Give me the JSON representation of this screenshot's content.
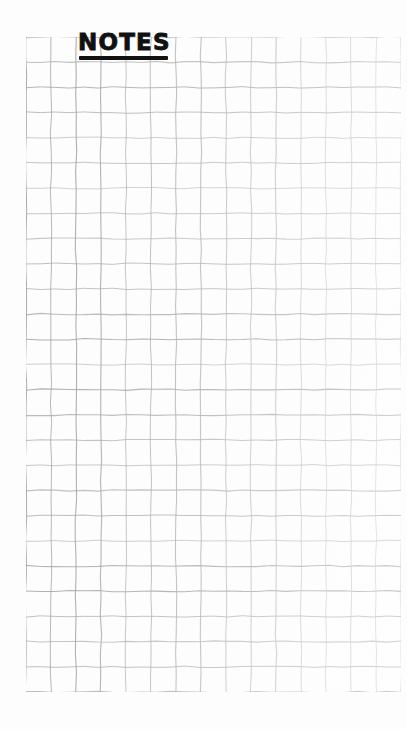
{
  "page": {
    "width": 407,
    "height": 729,
    "background_color": "#fdfdfd",
    "medium": "graph-paper-photo"
  },
  "title": {
    "text": "NOTES",
    "color": "#111111",
    "underline": true,
    "underline_color": "#111111"
  },
  "grid": {
    "columns": 15,
    "rows": 26,
    "cell_size_px": 25,
    "left_px": 26,
    "top_px": 37,
    "width_px": 375,
    "height_px": 655,
    "line_color_dark": "#9a9a9a",
    "line_color_light": "#d2d2d2",
    "style": "hand-drawn-wavy"
  },
  "content": {
    "body_text": "",
    "note": ""
  }
}
